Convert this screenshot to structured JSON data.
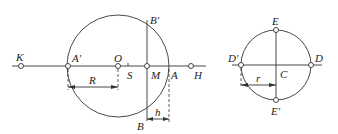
{
  "figure": {
    "left": {
      "circle_center": {
        "x": 118,
        "y": 66,
        "r": 51
      },
      "axis": {
        "x1": 12,
        "x2": 206,
        "y": 66
      },
      "points": [
        {
          "id": "K",
          "label": "K",
          "x": 21,
          "y": 66,
          "marker": true
        },
        {
          "id": "A_prime",
          "label": "A'",
          "x": 68,
          "y": 66,
          "marker": true
        },
        {
          "id": "O",
          "label": "O",
          "x": 118,
          "y": 66,
          "marker": true
        },
        {
          "id": "S",
          "label": "S",
          "x": 128,
          "y": 66,
          "marker": false
        },
        {
          "id": "M",
          "label": "M",
          "x": 147,
          "y": 66,
          "marker": true
        },
        {
          "id": "A",
          "label": "A",
          "x": 169,
          "y": 66,
          "marker": false
        },
        {
          "id": "H",
          "label": "H",
          "x": 191,
          "y": 66,
          "marker": true
        }
      ],
      "chord_labels": {
        "top": "B'",
        "bottom": "B"
      },
      "dimensions": {
        "R": "R",
        "h": "h"
      }
    },
    "right": {
      "circle_center": {
        "x": 276,
        "y": 65,
        "r": 35
      },
      "labels": {
        "E": "E",
        "E_prime": "E'",
        "D": "D",
        "D_prime": "D'",
        "C": "C",
        "r": "r"
      }
    }
  }
}
